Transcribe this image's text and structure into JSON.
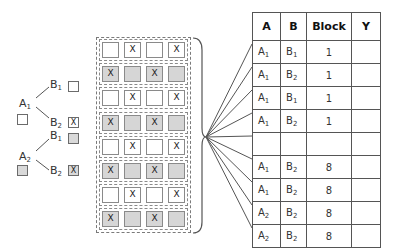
{
  "tree": {
    "factor_a": [
      {
        "label": "A",
        "sub": "1",
        "shade": "white",
        "branches": [
          {
            "label": "B",
            "sub": "1",
            "mark": ""
          },
          {
            "label": "B",
            "sub": "2",
            "mark": "X"
          }
        ]
      },
      {
        "label": "A",
        "sub": "2",
        "shade": "gray",
        "branches": [
          {
            "label": "B",
            "sub": "1",
            "mark": ""
          },
          {
            "label": "B",
            "sub": "2",
            "mark": "X"
          }
        ]
      }
    ]
  },
  "grid": {
    "rows": [
      {
        "shade": "white",
        "cells": [
          "",
          "X",
          "",
          "X"
        ]
      },
      {
        "shade": "gray",
        "cells": [
          "X",
          "",
          "X",
          ""
        ]
      },
      {
        "shade": "white",
        "cells": [
          "",
          "X",
          "",
          "X"
        ]
      },
      {
        "shade": "gray",
        "cells": [
          "X",
          "",
          "X",
          ""
        ]
      },
      {
        "shade": "white",
        "cells": [
          "",
          "X",
          "",
          "X"
        ]
      },
      {
        "shade": "gray",
        "cells": [
          "X",
          "",
          "X",
          ""
        ]
      },
      {
        "shade": "white",
        "cells": [
          "",
          "X",
          "",
          "X"
        ]
      },
      {
        "shade": "gray",
        "cells": [
          "X",
          "",
          "X",
          ""
        ]
      }
    ]
  },
  "table": {
    "headers": [
      "A",
      "B",
      "Block",
      "Y"
    ],
    "rows": [
      {
        "a": "A",
        "a_sub": "1",
        "b": "B",
        "b_sub": "1",
        "block": "1",
        "y": ""
      },
      {
        "a": "A",
        "a_sub": "1",
        "b": "B",
        "b_sub": "2",
        "block": "1",
        "y": ""
      },
      {
        "a": "A",
        "a_sub": "1",
        "b": "B",
        "b_sub": "1",
        "block": "1",
        "y": ""
      },
      {
        "a": "A",
        "a_sub": "1",
        "b": "B",
        "b_sub": "2",
        "block": "1",
        "y": ""
      },
      {
        "a": "",
        "a_sub": "",
        "b": "",
        "b_sub": "",
        "block": "",
        "y": ""
      },
      {
        "a": "A",
        "a_sub": "1",
        "b": "B",
        "b_sub": "2",
        "block": "8",
        "y": ""
      },
      {
        "a": "A",
        "a_sub": "1",
        "b": "B",
        "b_sub": "2",
        "block": "8",
        "y": ""
      },
      {
        "a": "A",
        "a_sub": "2",
        "b": "B",
        "b_sub": "2",
        "block": "8",
        "y": ""
      },
      {
        "a": "A",
        "a_sub": "2",
        "b": "B",
        "b_sub": "2",
        "block": "8",
        "y": ""
      }
    ]
  },
  "colors": {
    "gray_fill": "#d6d6d6",
    "line": "#555555",
    "dash": "#7a7a7a"
  }
}
